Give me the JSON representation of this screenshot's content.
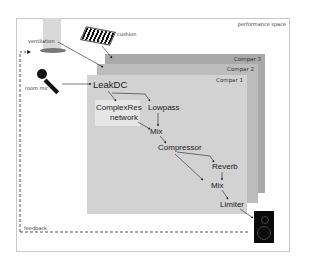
{
  "diagram": {
    "title": "performance space",
    "inputs": {
      "ventilation": "ventilation",
      "cushion": "cushion",
      "room_mic": "room mic"
    },
    "panels": [
      {
        "label": "Compar 3"
      },
      {
        "label": "Compar 2"
      },
      {
        "label": "Compar 1"
      }
    ],
    "nodes": {
      "leakdc": "LeakDC",
      "complexres_line1": "ComplexRes",
      "complexres_line2": "network",
      "lowpass": "Lowpass",
      "mix1": "Mix",
      "compressor": "Compressor",
      "reverb": "Reverb",
      "mix2": "Mix",
      "limiter": "Limiter"
    },
    "feedback_label": "feedback",
    "output_device": "speaker",
    "colors": {
      "panel3": "#a9a9a9",
      "panel2": "#bcbcbc",
      "panel1": "#d2d2d2",
      "highlight": "#e6e6e6",
      "arrow": "#222222"
    }
  }
}
